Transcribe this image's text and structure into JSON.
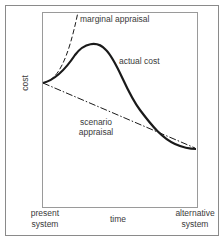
{
  "diagram": {
    "axis_labels": {
      "y": "cost",
      "x": "time",
      "x_start": [
        "present",
        "system"
      ],
      "x_end": [
        "alternative",
        "system"
      ]
    },
    "curves": [
      {
        "id": "marginal-appraisal",
        "label": "marginal appraisal",
        "style": "dashed"
      },
      {
        "id": "actual-cost",
        "label": "actual cost",
        "style": "solid-thick"
      },
      {
        "id": "scenario-appraisal",
        "label": [
          "scenario",
          "appraisal"
        ],
        "style": "dash-dot"
      }
    ],
    "colors": {
      "frame": "#8a8a8a",
      "curve": "#1a1a1a",
      "text": "#3a3a3a"
    }
  }
}
